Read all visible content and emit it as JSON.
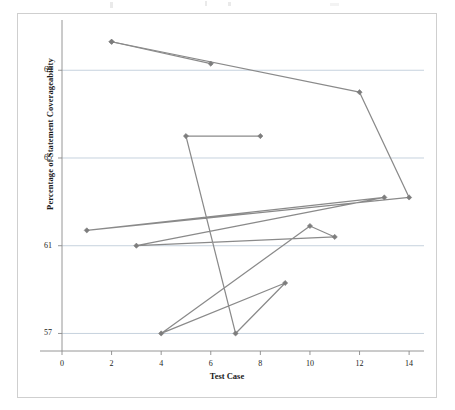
{
  "chart_data": {
    "type": "line",
    "title": "",
    "xlabel": "Test Case",
    "ylabel": "Percentage of Statement Coverageability",
    "xlim": [
      0,
      14.6
    ],
    "ylim": [
      56.2,
      71.2
    ],
    "xticks": [
      "0",
      "2",
      "4",
      "6",
      "8",
      "10",
      "12",
      "14"
    ],
    "xtick_values": [
      0,
      2,
      4,
      6,
      8,
      10,
      12,
      14
    ],
    "yticks": [
      "57",
      "61",
      "65",
      "69"
    ],
    "ytick_values": [
      57,
      61,
      65,
      69
    ],
    "grid": "horizontal",
    "legend": "none",
    "marker": "diamond",
    "line_color": "#8a8a8a",
    "marker_color": "#7d7d7d",
    "grid_color": "#b9c6d6",
    "axis_color": "#8a8a8a",
    "series": [
      {
        "name": "Series 1",
        "x": [
          2,
          12,
          14,
          1,
          13,
          3,
          11,
          10,
          4,
          9,
          7,
          5,
          8
        ],
        "y": [
          70.3,
          68.0,
          63.2,
          61.7,
          63.2,
          61.0,
          61.4,
          61.9,
          57.0,
          59.3,
          57.0,
          66.0,
          66.0
        ],
        "points": [
          {
            "x": 2,
            "y": 70.3
          },
          {
            "x": 12,
            "y": 68.0
          },
          {
            "x": 14,
            "y": 63.2
          },
          {
            "x": 1,
            "y": 61.7
          },
          {
            "x": 13,
            "y": 63.2
          },
          {
            "x": 3,
            "y": 61.0
          },
          {
            "x": 11,
            "y": 61.4
          },
          {
            "x": 10,
            "y": 61.9
          },
          {
            "x": 4,
            "y": 57.0
          },
          {
            "x": 9,
            "y": 59.3
          },
          {
            "x": 7,
            "y": 57.0
          },
          {
            "x": 5,
            "y": 66.0
          },
          {
            "x": 8,
            "y": 66.0
          }
        ]
      },
      {
        "name": "Series 2",
        "x": [
          2,
          6
        ],
        "y": [
          70.3,
          69.3
        ],
        "points": [
          {
            "x": 2,
            "y": 70.3
          },
          {
            "x": 6,
            "y": 69.3
          }
        ]
      }
    ]
  },
  "chart": {
    "xlabel": "Test Case",
    "ylabel": "Percentage of Statement Coverageability"
  }
}
